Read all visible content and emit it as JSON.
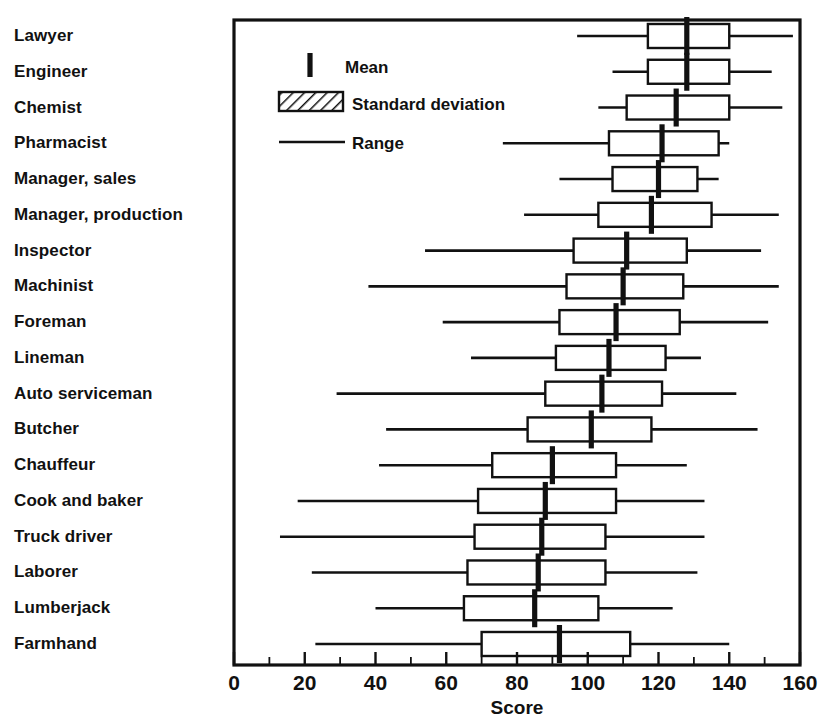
{
  "chart_data": {
    "type": "bar",
    "title": "",
    "xlabel": "Score",
    "ylabel": "",
    "xlim": [
      0,
      160
    ],
    "xticks": [
      0,
      20,
      40,
      60,
      80,
      100,
      120,
      140,
      160
    ],
    "xtick_labels": [
      "0",
      "20",
      "40",
      "60",
      "80",
      "100",
      "120",
      "140",
      "160"
    ],
    "minor_tick_step": 10,
    "grid": false,
    "legend_position": "upper-left-inside",
    "legend": [
      {
        "key": "mean",
        "label": "Mean",
        "marker": "vertical-tick"
      },
      {
        "key": "sd",
        "label": "Standard deviation",
        "marker": "hatched-box"
      },
      {
        "key": "range",
        "label": "Range",
        "marker": "horizontal-line"
      }
    ],
    "categories": [
      "Lawyer",
      "Engineer",
      "Chemist",
      "Pharmacist",
      "Manager, sales",
      "Manager, production",
      "Inspector",
      "Machinist",
      "Foreman",
      "Lineman",
      "Auto serviceman",
      "Butcher",
      "Chauffeur",
      "Cook and baker",
      "Truck driver",
      "Laborer",
      "Lumberjack",
      "Farmhand"
    ],
    "series": [
      {
        "name": "range_min",
        "values": [
          97,
          107,
          103,
          76,
          92,
          82,
          54,
          38,
          59,
          67,
          29,
          43,
          41,
          18,
          13,
          22,
          40,
          23
        ]
      },
      {
        "name": "sd_low",
        "values": [
          117,
          117,
          111,
          106,
          107,
          103,
          96,
          94,
          92,
          91,
          88,
          83,
          73,
          69,
          68,
          66,
          65,
          70
        ]
      },
      {
        "name": "mean",
        "values": [
          128,
          128,
          125,
          121,
          120,
          118,
          111,
          110,
          108,
          106,
          104,
          101,
          90,
          88,
          87,
          86,
          85,
          92
        ]
      },
      {
        "name": "sd_high",
        "values": [
          140,
          140,
          140,
          137,
          131,
          135,
          128,
          127,
          126,
          122,
          121,
          118,
          108,
          108,
          105,
          105,
          103,
          112
        ]
      },
      {
        "name": "range_max",
        "values": [
          158,
          152,
          155,
          140,
          137,
          154,
          149,
          154,
          151,
          132,
          142,
          148,
          128,
          133,
          133,
          131,
          124,
          140
        ]
      }
    ]
  },
  "legend": {
    "mean_label": "Mean",
    "sd_label": "Standard deviation",
    "range_label": "Range"
  },
  "axis": {
    "x_title": "Score"
  }
}
